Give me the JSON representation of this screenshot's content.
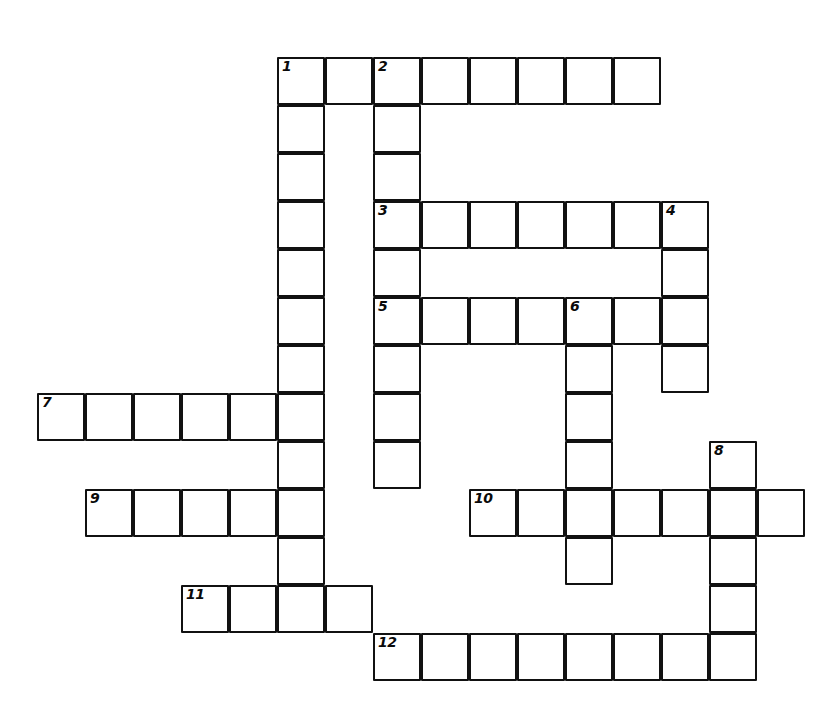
{
  "puzzle": {
    "kind": "crossword-grid",
    "title": "Crossword puzzle grid",
    "cell_size_px": 48,
    "origin_x_px": 277,
    "origin_y_px": 57,
    "ink_color": "#111111",
    "cell_fill_color": "#ffffff",
    "page_background": "#ffffff",
    "number_count": 12,
    "cell_count": 71,
    "numbers_visible": [
      "1",
      "2",
      "3",
      "4",
      "5",
      "6",
      "7",
      "8",
      "9",
      "10",
      "11",
      "12"
    ],
    "entries": {
      "across": [
        {
          "number": "1",
          "row": 0,
          "col_start": 0,
          "length": 8
        },
        {
          "number": "3",
          "row": 3,
          "col_start": 2,
          "length": 7
        },
        {
          "number": "5",
          "row": 5,
          "col_start": 2,
          "length": 7
        },
        {
          "number": "7",
          "row": 7,
          "col_start": -5,
          "length": 6
        },
        {
          "number": "9",
          "row": 9,
          "col_start": -4,
          "length": 5
        },
        {
          "number": "10",
          "row": 9,
          "col_start": 4,
          "length": 7
        },
        {
          "number": "11",
          "row": 11,
          "col_start": -2,
          "length": 4
        },
        {
          "number": "12",
          "row": 12,
          "col_start": 2,
          "length": 8
        }
      ],
      "down": [
        {
          "number": "1",
          "col": 0,
          "row_start": 0,
          "length": 12
        },
        {
          "number": "2",
          "col": 2,
          "row_start": 0,
          "length": 9
        },
        {
          "number": "4",
          "col": 8,
          "row_start": 3,
          "length": 4
        },
        {
          "number": "6",
          "col": 6,
          "row_start": 5,
          "length": 7
        },
        {
          "number": "8",
          "col": 9,
          "row_start": 8,
          "length": 5
        }
      ]
    },
    "cells": [
      {
        "row": 0,
        "col": 0,
        "number": "1"
      },
      {
        "row": 0,
        "col": 1,
        "number": ""
      },
      {
        "row": 0,
        "col": 2,
        "number": "2"
      },
      {
        "row": 0,
        "col": 3,
        "number": ""
      },
      {
        "row": 0,
        "col": 4,
        "number": ""
      },
      {
        "row": 0,
        "col": 5,
        "number": ""
      },
      {
        "row": 0,
        "col": 6,
        "number": ""
      },
      {
        "row": 0,
        "col": 7,
        "number": ""
      },
      {
        "row": 1,
        "col": 0,
        "number": ""
      },
      {
        "row": 1,
        "col": 2,
        "number": ""
      },
      {
        "row": 2,
        "col": 0,
        "number": ""
      },
      {
        "row": 2,
        "col": 2,
        "number": ""
      },
      {
        "row": 3,
        "col": 0,
        "number": ""
      },
      {
        "row": 3,
        "col": 2,
        "number": "3"
      },
      {
        "row": 3,
        "col": 3,
        "number": ""
      },
      {
        "row": 3,
        "col": 4,
        "number": ""
      },
      {
        "row": 3,
        "col": 5,
        "number": ""
      },
      {
        "row": 3,
        "col": 6,
        "number": ""
      },
      {
        "row": 3,
        "col": 7,
        "number": ""
      },
      {
        "row": 3,
        "col": 8,
        "number": "4"
      },
      {
        "row": 4,
        "col": 0,
        "number": ""
      },
      {
        "row": 4,
        "col": 2,
        "number": ""
      },
      {
        "row": 4,
        "col": 8,
        "number": ""
      },
      {
        "row": 5,
        "col": 0,
        "number": ""
      },
      {
        "row": 5,
        "col": 2,
        "number": "5"
      },
      {
        "row": 5,
        "col": 3,
        "number": ""
      },
      {
        "row": 5,
        "col": 4,
        "number": ""
      },
      {
        "row": 5,
        "col": 5,
        "number": ""
      },
      {
        "row": 5,
        "col": 6,
        "number": "6"
      },
      {
        "row": 5,
        "col": 7,
        "number": ""
      },
      {
        "row": 5,
        "col": 8,
        "number": ""
      },
      {
        "row": 6,
        "col": 0,
        "number": ""
      },
      {
        "row": 6,
        "col": 2,
        "number": ""
      },
      {
        "row": 6,
        "col": 6,
        "number": ""
      },
      {
        "row": 6,
        "col": 8,
        "number": ""
      },
      {
        "row": 7,
        "col": -5,
        "number": "7"
      },
      {
        "row": 7,
        "col": -4,
        "number": ""
      },
      {
        "row": 7,
        "col": -3,
        "number": ""
      },
      {
        "row": 7,
        "col": -2,
        "number": ""
      },
      {
        "row": 7,
        "col": -1,
        "number": ""
      },
      {
        "row": 7,
        "col": 0,
        "number": ""
      },
      {
        "row": 7,
        "col": 2,
        "number": ""
      },
      {
        "row": 7,
        "col": 6,
        "number": ""
      },
      {
        "row": 8,
        "col": 0,
        "number": ""
      },
      {
        "row": 8,
        "col": 2,
        "number": ""
      },
      {
        "row": 8,
        "col": 6,
        "number": ""
      },
      {
        "row": 8,
        "col": 9,
        "number": "8"
      },
      {
        "row": 9,
        "col": -4,
        "number": "9"
      },
      {
        "row": 9,
        "col": -3,
        "number": ""
      },
      {
        "row": 9,
        "col": -2,
        "number": ""
      },
      {
        "row": 9,
        "col": -1,
        "number": ""
      },
      {
        "row": 9,
        "col": 0,
        "number": ""
      },
      {
        "row": 9,
        "col": 4,
        "number": "10"
      },
      {
        "row": 9,
        "col": 5,
        "number": ""
      },
      {
        "row": 9,
        "col": 6,
        "number": ""
      },
      {
        "row": 9,
        "col": 7,
        "number": ""
      },
      {
        "row": 9,
        "col": 8,
        "number": ""
      },
      {
        "row": 9,
        "col": 9,
        "number": ""
      },
      {
        "row": 9,
        "col": 10,
        "number": ""
      },
      {
        "row": 10,
        "col": 0,
        "number": ""
      },
      {
        "row": 10,
        "col": 6,
        "number": ""
      },
      {
        "row": 10,
        "col": 9,
        "number": ""
      },
      {
        "row": 11,
        "col": -2,
        "number": "11"
      },
      {
        "row": 11,
        "col": -1,
        "number": ""
      },
      {
        "row": 11,
        "col": 0,
        "number": ""
      },
      {
        "row": 11,
        "col": 1,
        "number": ""
      },
      {
        "row": 11,
        "col": 9,
        "number": ""
      },
      {
        "row": 12,
        "col": 2,
        "number": "12"
      },
      {
        "row": 12,
        "col": 3,
        "number": ""
      },
      {
        "row": 12,
        "col": 4,
        "number": ""
      },
      {
        "row": 12,
        "col": 5,
        "number": ""
      },
      {
        "row": 12,
        "col": 6,
        "number": ""
      },
      {
        "row": 12,
        "col": 7,
        "number": ""
      },
      {
        "row": 12,
        "col": 8,
        "number": ""
      },
      {
        "row": 12,
        "col": 9,
        "number": ""
      }
    ]
  }
}
